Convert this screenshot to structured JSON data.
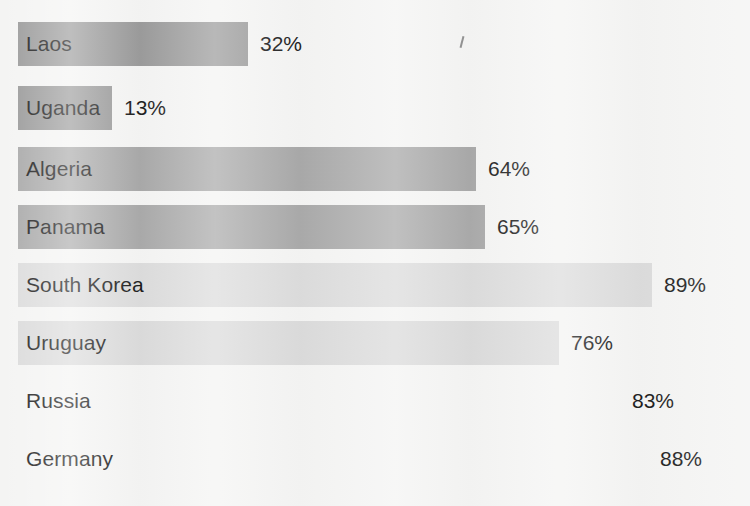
{
  "chart_data": {
    "type": "bar",
    "orientation": "horizontal",
    "title": "",
    "subtitle": "",
    "xlabel": "",
    "ylabel": "",
    "xlim": [
      0,
      100
    ],
    "grid": false,
    "legend": "none",
    "value_suffix": "%",
    "categories": [
      "Laos",
      "Uganda",
      "Algeria",
      "Panama",
      "South Korea",
      "Uruguay",
      "Russia",
      "Germany"
    ],
    "values": [
      32,
      13,
      64,
      65,
      89,
      76,
      83,
      88
    ],
    "value_labels": [
      "32%",
      "13%",
      "64%",
      "65%",
      "89%",
      "76%",
      "83%",
      "88%"
    ],
    "bar_colors": [
      "#9b9b9b",
      "#9b9b9b",
      "#a9a9a9",
      "#aaaaaa",
      "#dcdcdc",
      "#dbdbdb",
      "#f4f4f3",
      "#f4f4f3"
    ],
    "background_color": "#f4f4f3",
    "text_color": "#1d1d1d",
    "bars": [
      {
        "category": "Laos",
        "value": 32,
        "label": "32%",
        "color": "#9b9b9b",
        "bar_end_px": 248,
        "row_top_px": 22,
        "row_height_px": 44
      },
      {
        "category": "Uganda",
        "value": 13,
        "label": "13%",
        "color": "#9b9b9b",
        "bar_end_px": 112,
        "row_top_px": 86,
        "row_height_px": 44
      },
      {
        "category": "Algeria",
        "value": 64,
        "label": "64%",
        "color": "#a9a9a9",
        "bar_end_px": 476,
        "row_top_px": 147,
        "row_height_px": 44
      },
      {
        "category": "Panama",
        "value": 65,
        "label": "65%",
        "color": "#aaaaaa",
        "bar_end_px": 485,
        "row_top_px": 205,
        "row_height_px": 44
      },
      {
        "category": "South Korea",
        "value": 89,
        "label": "89%",
        "color": "#dcdcdc",
        "bar_end_px": 652,
        "row_top_px": 263,
        "row_height_px": 44
      },
      {
        "category": "Uruguay",
        "value": 76,
        "label": "76%",
        "color": "#dbdbdb",
        "bar_end_px": 559,
        "row_top_px": 321,
        "row_height_px": 44
      },
      {
        "category": "Russia",
        "value": 83,
        "label": "83%",
        "color": "#f4f4f3",
        "bar_end_px": 620,
        "row_top_px": 379,
        "row_height_px": 44
      },
      {
        "category": "Germany",
        "value": 88,
        "label": "88%",
        "color": "#f4f4f3",
        "bar_end_px": 648,
        "row_top_px": 437,
        "row_height_px": 44
      }
    ]
  }
}
